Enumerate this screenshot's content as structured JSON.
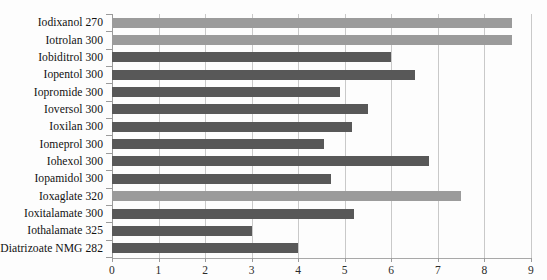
{
  "chart_data": {
    "type": "bar",
    "orientation": "horizontal",
    "title": "",
    "subtitle": "",
    "xlabel": "",
    "ylabel": "",
    "xlim": [
      0,
      9
    ],
    "xticks": [
      0,
      1,
      2,
      3,
      4,
      5,
      6,
      7,
      8,
      9
    ],
    "xtick_labels": [
      "0",
      "1",
      "2",
      "3",
      "4",
      "5",
      "6",
      "7",
      "8",
      "9"
    ],
    "grid": true,
    "legend": "none",
    "categories": [
      "Iodixanol 270",
      "Iotrolan 300",
      "Iobiditrol 300",
      "Iopentol 300",
      "Iopromide 300",
      "Ioversol 300",
      "Ioxilan 300",
      "Iomeprol 300",
      "Iohexol 300",
      "Iopamidol 300",
      "Ioxaglate 320",
      "Ioxitalamate  300",
      "Iothalamate 325",
      "Diatrizoate NMG 282"
    ],
    "values": [
      8.6,
      8.6,
      6.0,
      6.5,
      4.9,
      5.5,
      5.15,
      4.55,
      6.8,
      4.7,
      7.5,
      5.2,
      3.0,
      4.0
    ],
    "bar_colors": [
      "#9b9b9b",
      "#9b9b9b",
      "#585858",
      "#585858",
      "#585858",
      "#585858",
      "#585858",
      "#585858",
      "#585858",
      "#585858",
      "#9b9b9b",
      "#585858",
      "#585858",
      "#585858"
    ],
    "colors": {
      "dark_bar": "#585858",
      "light_bar": "#9b9b9b",
      "gridline": "#c9c9c9",
      "axis": "#9b9b9b",
      "text": "#111111",
      "background": "#fdfdfd"
    }
  }
}
